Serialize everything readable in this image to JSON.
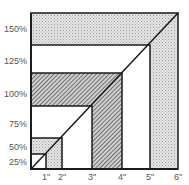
{
  "diagram": {
    "y_axis": {
      "labels": [
        {
          "text": "150%",
          "y": 24
        },
        {
          "text": "125%",
          "y": 56
        },
        {
          "text": "100%",
          "y": 89
        },
        {
          "text": "75%",
          "y": 119
        },
        {
          "text": "50%",
          "y": 142
        },
        {
          "text": "25%",
          "y": 157
        }
      ]
    },
    "x_axis": {
      "labels": [
        {
          "text": "1\"",
          "x": 46
        },
        {
          "text": "2\"",
          "x": 62
        },
        {
          "text": "3\"",
          "x": 92
        },
        {
          "text": "4\"",
          "x": 122
        },
        {
          "text": "5\"",
          "x": 150
        },
        {
          "text": "6\"",
          "x": 178
        }
      ]
    },
    "squares": [
      {
        "size": "6\"",
        "fill": "stipple"
      },
      {
        "size": "5\"",
        "fill": "white"
      },
      {
        "size": "4\"",
        "fill": "hatch"
      },
      {
        "size": "3\"",
        "fill": "white"
      },
      {
        "size": "2\"",
        "fill": "stipple"
      },
      {
        "size": "1\"",
        "fill": "white"
      }
    ],
    "colors": {
      "line": "#1a1a1a",
      "stipple_bg": "#e6e6e6",
      "stipple_dot": "#9a9a9a",
      "hatch_bg": "#d0d0d0",
      "hatch_line": "#3a3a3a",
      "label": "#555555"
    }
  }
}
